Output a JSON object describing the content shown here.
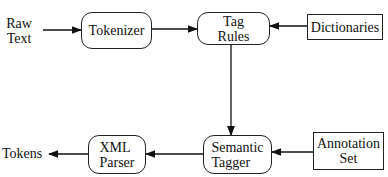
{
  "diagram": {
    "inputs": {
      "raw_text": "Raw\nText"
    },
    "outputs": {
      "tokens": "Tokens"
    },
    "nodes": {
      "tokenizer": "Tokenizer",
      "tag_rules": "Tag\nRules",
      "dictionaries": "Dictionaries",
      "semantic_tagger": "Semantic\nTagger",
      "annotation_set": "Annotation\nSet",
      "xml_parser": "XML\nParser"
    },
    "edges": [
      {
        "from": "Raw Text",
        "to": "Tokenizer"
      },
      {
        "from": "Tokenizer",
        "to": "Tag Rules"
      },
      {
        "from": "Dictionaries",
        "to": "Tag Rules"
      },
      {
        "from": "Tag Rules",
        "to": "Semantic Tagger"
      },
      {
        "from": "Annotation Set",
        "to": "Semantic Tagger"
      },
      {
        "from": "Semantic Tagger",
        "to": "XML Parser"
      },
      {
        "from": "XML Parser",
        "to": "Tokens"
      }
    ]
  }
}
